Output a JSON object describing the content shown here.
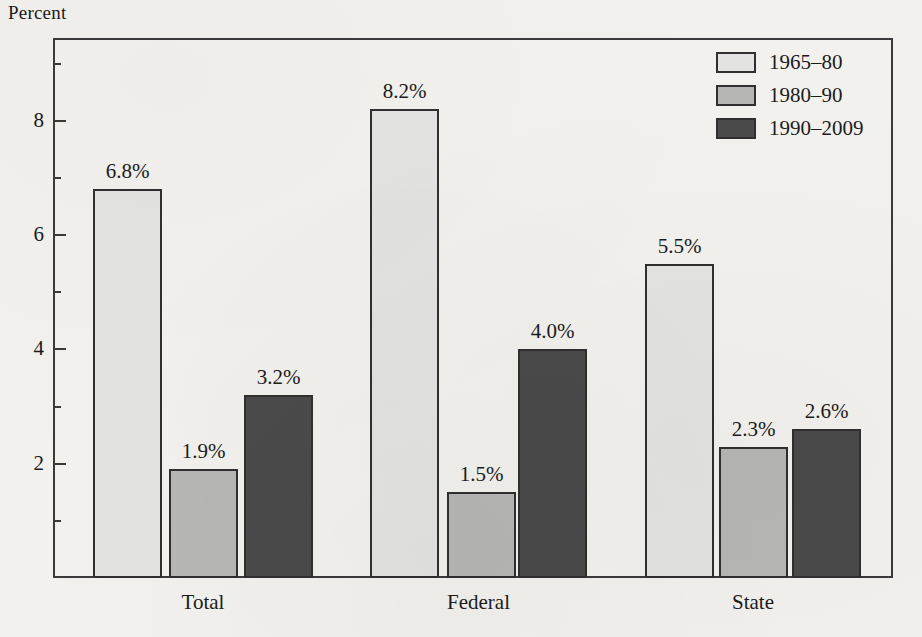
{
  "chart_data": {
    "type": "bar",
    "title": "",
    "ylabel": "Percent",
    "xlabel": "",
    "categories": [
      "Total",
      "Federal",
      "State"
    ],
    "series": [
      {
        "name": "1965–80",
        "color": "#e3e3e1",
        "values": [
          6.8,
          8.2,
          5.5
        ],
        "labels": [
          "6.8%",
          "8.2%",
          "5.5%"
        ]
      },
      {
        "name": "1980–90",
        "color": "#b6b6b4",
        "values": [
          1.9,
          1.5,
          2.3
        ],
        "labels": [
          "1.9%",
          "1.5%",
          "2.3%"
        ]
      },
      {
        "name": "1990–2009",
        "color": "#4a4a4a",
        "values": [
          3.2,
          4.0,
          2.6
        ],
        "labels": [
          "3.2%",
          "4.0%",
          "2.6%"
        ]
      }
    ],
    "ylim": [
      0,
      9.45
    ],
    "ytick_major": [
      2,
      4,
      6,
      8
    ],
    "ytick_major_labels": [
      "2",
      "4",
      "6",
      "8"
    ],
    "ytick_minor": [
      1,
      3,
      5,
      7,
      9
    ],
    "grid": false,
    "legend_position": "top-right",
    "value_labels_shown": true
  },
  "axis": {
    "y_title": "Percent"
  },
  "legend": {
    "items": [
      {
        "label": "1965–80"
      },
      {
        "label": "1980–90"
      },
      {
        "label": "1990–2009"
      }
    ]
  }
}
